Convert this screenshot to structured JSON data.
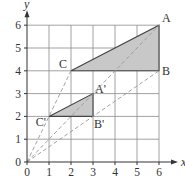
{
  "figure": {
    "type": "enlargement-diagram",
    "axes": {
      "x_label": "x",
      "y_label": "y",
      "x_ticks": [
        "0",
        "1",
        "2",
        "3",
        "4",
        "5",
        "6"
      ],
      "y_ticks": [
        "0",
        "1",
        "2",
        "3",
        "4",
        "5",
        "6"
      ],
      "x_range": [
        0,
        6
      ],
      "y_range": [
        0,
        6
      ],
      "grid": true
    },
    "triangles": [
      {
        "name": "ABC",
        "vertices": [
          {
            "label": "A",
            "x": 6,
            "y": 6
          },
          {
            "label": "B",
            "x": 6,
            "y": 4
          },
          {
            "label": "C",
            "x": 2,
            "y": 4
          }
        ],
        "fill": "#c8c8c8"
      },
      {
        "name": "A'B'C'",
        "vertices": [
          {
            "label": "A'",
            "x": 3,
            "y": 3
          },
          {
            "label": "B'",
            "x": 3,
            "y": 2
          },
          {
            "label": "C'",
            "x": 1,
            "y": 2
          }
        ],
        "fill": "#c8c8c8"
      }
    ],
    "rays_from_origin": [
      {
        "to": "A",
        "x": 6,
        "y": 6
      },
      {
        "to": "B",
        "x": 6,
        "y": 4
      },
      {
        "to": "C",
        "x": 2,
        "y": 4
      }
    ],
    "colors": {
      "grid": "#8a8a8a",
      "axis": "#333333",
      "triangle_fill": "#c8c8c8",
      "triangle_edge": "#444444",
      "ray": "#999999"
    }
  }
}
